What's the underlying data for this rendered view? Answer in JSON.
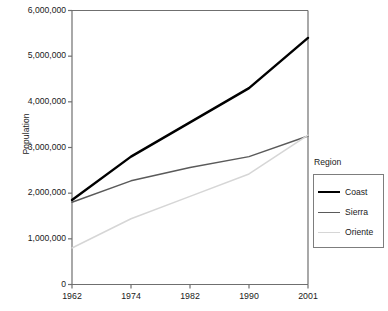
{
  "chart_data": {
    "type": "line",
    "title": "",
    "xlabel": "",
    "ylabel": "Population",
    "categories": [
      "1962",
      "1974",
      "1982",
      "1990",
      "2001"
    ],
    "ylim": [
      0,
      6000000
    ],
    "ytick_values": [
      0,
      1000000,
      2000000,
      3000000,
      4000000,
      5000000,
      6000000
    ],
    "ytick_labels": [
      "0",
      "1,000,000",
      "2,000,000",
      "3,000,000",
      "4,000,000",
      "5,000,000",
      "6,000,000"
    ],
    "grid": false,
    "legend_position": "right",
    "legend_title": "Region",
    "series": [
      {
        "name": "Coast",
        "color": "#000000",
        "width": 2.4,
        "values": [
          1850000,
          2800000,
          3550000,
          4300000,
          5400000
        ]
      },
      {
        "name": "Sierra",
        "color": "#5a5a5a",
        "width": 1.5,
        "values": [
          1800000,
          2270000,
          2560000,
          2800000,
          3250000
        ]
      },
      {
        "name": "Oriente",
        "color": "#d6d6d6",
        "width": 1.5,
        "values": [
          800000,
          1440000,
          1930000,
          2420000,
          3270000
        ]
      }
    ]
  },
  "axes": {
    "y_title": "Population"
  },
  "legend": {
    "title": "Region",
    "entries": [
      {
        "label": "Coast"
      },
      {
        "label": "Sierra"
      },
      {
        "label": "Oriente"
      }
    ]
  },
  "colors": {
    "axis": "#6f6f6f",
    "text": "#1a1a1a",
    "coast": "#000000",
    "sierra": "#5a5a5a",
    "oriente": "#d6d6d6"
  }
}
